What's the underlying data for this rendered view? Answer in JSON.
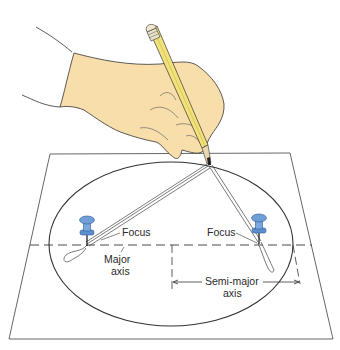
{
  "diagram": {
    "labels": {
      "focus_left": "Focus",
      "focus_right": "Focus",
      "major_axis_line1": "Major",
      "major_axis_line2": "axis",
      "semi_major_line1": "Semi-major",
      "semi_major_line2": "axis"
    },
    "colors": {
      "skin": "#f7deaa",
      "pencil": "#f3e27a",
      "pin": "#6f9fd6",
      "pin_dark": "#3e6fae",
      "line": "#3a3a3a",
      "paper": "#ffffff"
    }
  }
}
